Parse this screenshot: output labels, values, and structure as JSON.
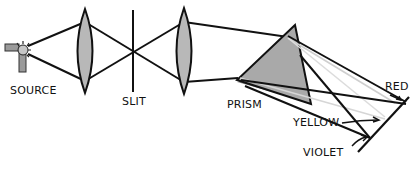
{
  "diagram": {
    "labels": {
      "source": "SOURCE",
      "slit": "SLIT",
      "prism": "PRISM",
      "red": "RED",
      "yellow": "YELLOW",
      "violet": "VIOLET"
    },
    "components": [
      "source",
      "lens-1",
      "slit",
      "lens-2",
      "prism",
      "screen"
    ],
    "colors": {
      "stroke": "#111111",
      "lens_fill": "#b8b8b8",
      "prism_fill": "#a9a9a9",
      "faint_ray": "#cfcfcf",
      "background": "#ffffff"
    }
  }
}
